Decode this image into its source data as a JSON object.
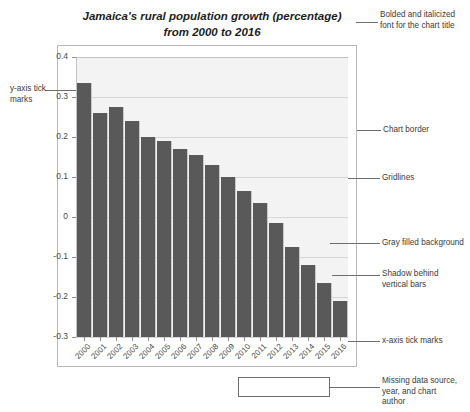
{
  "chart_data": {
    "type": "bar",
    "title": "Jamaica's rural population growth (percentage) from 2000 to 2016",
    "title_lines": [
      "Jamaica's rural population growth (percentage)",
      "from 2000 to 2016"
    ],
    "xlabel": "",
    "ylabel": "",
    "ylim": [
      -0.3,
      0.4
    ],
    "y_ticks": [
      0.4,
      0.3,
      0.2,
      0.1,
      0,
      -0.1,
      -0.2,
      -0.3
    ],
    "y_tick_labels": [
      "0.4",
      "0.3",
      "0.2",
      "0.1",
      "0",
      "-0.1",
      "-0.2",
      "-0.3"
    ],
    "grid": true,
    "grid_axis": "y",
    "legend": false,
    "categories": [
      "2000",
      "2001",
      "2002",
      "2003",
      "2004",
      "2005",
      "2006",
      "2007",
      "2008",
      "2009",
      "2010",
      "2011",
      "2012",
      "2013",
      "2014",
      "2015",
      "2016"
    ],
    "values": [
      0.335,
      0.26,
      0.275,
      0.24,
      0.2,
      0.19,
      0.17,
      0.155,
      0.13,
      0.1,
      0.065,
      0.035,
      -0.015,
      -0.075,
      -0.12,
      -0.165,
      -0.21
    ],
    "bar_color": "#595959",
    "shadow_color": "#c9c9c9",
    "plot_background": "#f3f3f3",
    "gridline_color": "#d5d5d5",
    "border_color": "#b9b9b9"
  },
  "annotations": [
    {
      "id": "title-note",
      "lines": [
        "Bolded and italicized",
        "font for the chart title"
      ]
    },
    {
      "id": "y-tick-note",
      "lines": [
        "y-axis tick",
        "marks"
      ]
    },
    {
      "id": "chart-border-note",
      "lines": [
        "Chart border"
      ]
    },
    {
      "id": "gridlines-note",
      "lines": [
        "Gridlines"
      ]
    },
    {
      "id": "gray-background-note",
      "lines": [
        "Gray filled background"
      ]
    },
    {
      "id": "shadow-note",
      "lines": [
        "Shadow behind",
        "vertical bars"
      ]
    },
    {
      "id": "x-tick-note",
      "lines": [
        "x-axis tick marks"
      ]
    },
    {
      "id": "missing-source-note",
      "lines": [
        "Missing data source,",
        "year, and chart",
        "author"
      ]
    }
  ],
  "caption_box": {
    "text": ""
  }
}
